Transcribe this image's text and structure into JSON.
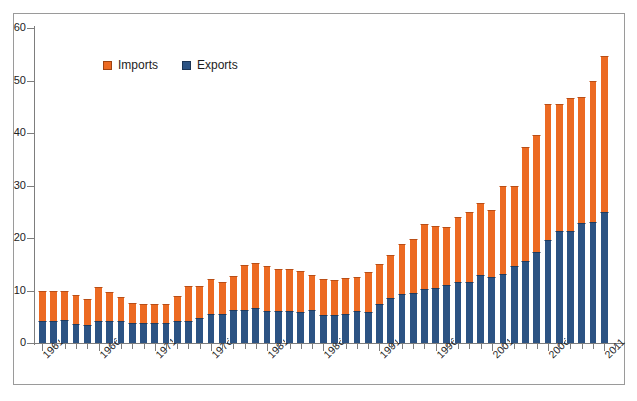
{
  "chart_data": {
    "type": "bar",
    "subtype": "stacked-bar",
    "title": "",
    "subtitle": "",
    "xlabel": "",
    "ylabel": "",
    "ylim": [
      0,
      60
    ],
    "y_ticks": [
      0,
      10,
      20,
      30,
      40,
      50,
      60
    ],
    "y_tick_labels": [
      "0",
      "10",
      "20",
      "30",
      "40",
      "50",
      "60"
    ],
    "grid": false,
    "legend_position": "top-left-inside",
    "stack_order": [
      "Exports",
      "Imports"
    ],
    "colors": {
      "imports": "#ec6a22",
      "exports": "#2c5383",
      "axis": "#7d7d7d",
      "frame": "#9a9a9a",
      "text": "#1c1c1c",
      "background": "#ffffff"
    },
    "categories": [
      1961,
      1962,
      1963,
      1964,
      1965,
      1966,
      1967,
      1968,
      1969,
      1970,
      1971,
      1972,
      1973,
      1974,
      1975,
      1976,
      1977,
      1978,
      1979,
      1980,
      1981,
      1982,
      1983,
      1984,
      1985,
      1986,
      1987,
      1988,
      1989,
      1990,
      1991,
      1992,
      1993,
      1994,
      1995,
      1996,
      1997,
      1998,
      1999,
      2000,
      2001,
      2002,
      2003,
      2004,
      2005,
      2006,
      2007,
      2008,
      2009,
      2010,
      2011
    ],
    "x_tick_labels_shown": [
      "1961",
      "1966",
      "1971",
      "1976",
      "1981",
      "1986",
      "1991",
      "1996",
      "2001",
      "2006",
      "2011"
    ],
    "x_tick_label_interval": 5,
    "series": [
      {
        "name": "Exports",
        "color": "#2c5383",
        "values": [
          4.2,
          4.2,
          4.3,
          3.7,
          3.4,
          4.1,
          4.1,
          4.1,
          3.8,
          3.8,
          3.8,
          3.8,
          4.1,
          4.2,
          4.8,
          5.5,
          5.6,
          6.2,
          6.2,
          6.6,
          6.0,
          6.0,
          6.0,
          5.9,
          6.2,
          5.3,
          5.3,
          5.6,
          6.1,
          6.0,
          7.5,
          8.5,
          9.4,
          9.6,
          10.3,
          10.5,
          11.1,
          11.6,
          11.6,
          12.9,
          12.6,
          13.2,
          14.6,
          15.6,
          17.4,
          19.7,
          21.4,
          21.3,
          22.8,
          23.0,
          25.0
        ]
      },
      {
        "name": "Imports",
        "color": "#ec6a22",
        "values": [
          5.8,
          5.8,
          5.7,
          5.5,
          4.9,
          6.5,
          5.7,
          4.7,
          3.8,
          3.7,
          3.7,
          3.7,
          4.8,
          6.6,
          6.0,
          6.7,
          6.1,
          6.5,
          8.7,
          8.6,
          8.6,
          8.1,
          8.1,
          7.8,
          6.8,
          6.9,
          6.7,
          6.7,
          6.4,
          7.5,
          7.6,
          8.3,
          9.5,
          10.2,
          12.3,
          11.7,
          11.0,
          12.4,
          13.4,
          13.7,
          12.7,
          16.8,
          15.4,
          21.7,
          22.2,
          25.8,
          24.1,
          25.4,
          24.0,
          27.0,
          29.7
        ]
      }
    ],
    "totals": [
      10.0,
      10.0,
      10.0,
      9.2,
      8.3,
      10.6,
      9.8,
      8.8,
      7.6,
      7.5,
      7.5,
      7.5,
      8.9,
      10.8,
      10.8,
      12.2,
      11.7,
      12.7,
      14.9,
      15.2,
      14.6,
      14.1,
      14.1,
      13.7,
      13.0,
      12.2,
      12.0,
      12.3,
      12.5,
      13.5,
      15.1,
      16.8,
      18.9,
      19.8,
      22.6,
      22.2,
      22.1,
      24.0,
      25.0,
      26.6,
      25.3,
      30.0,
      30.0,
      37.3,
      39.6,
      45.5,
      45.5,
      46.7,
      46.8,
      50.0,
      54.7
    ]
  },
  "legend": {
    "entries": [
      {
        "label": "Imports",
        "swatch": "imports-swatch"
      },
      {
        "label": "Exports",
        "swatch": "exports-swatch"
      }
    ]
  }
}
